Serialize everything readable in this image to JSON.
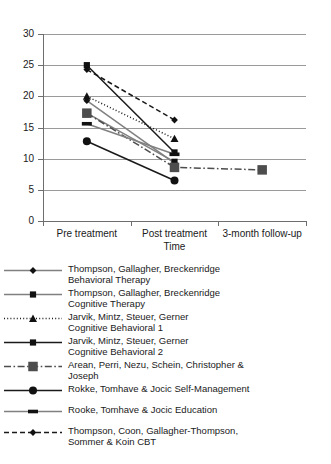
{
  "chart_data": {
    "type": "line",
    "title": "",
    "xlabel": "Time",
    "ylabel": "",
    "categories": [
      "Pre treatment",
      "Post treatment",
      "3-month follow-up"
    ],
    "ylim": [
      0,
      30
    ],
    "yticks": [
      0,
      5,
      10,
      15,
      20,
      25,
      30
    ],
    "grid": true,
    "legend_position": "below",
    "series": [
      {
        "name": "Thompson, Gallagher, Breckenridge Behavioral Therapy",
        "label_line1": "Thompson, Gallagher, Breckenridge",
        "label_line2": "Behavioral Therapy",
        "marker": "diamond",
        "line_style": "solid",
        "color": "#808080",
        "values": [
          19.3,
          9.3,
          null
        ]
      },
      {
        "name": "Thompson, Gallagher, Breckenridge Cognitive Therapy",
        "label_line1": "Thompson, Gallagher, Breckenridge",
        "label_line2": "Cognitive Therapy",
        "marker": "square",
        "line_style": "solid",
        "color": "#808080",
        "values": [
          17.3,
          9.5,
          null
        ]
      },
      {
        "name": "Jarvik, Mintz, Steuer, Gerner Cognitive Behavioral 1",
        "label_line1": "Jarvik, Mintz, Steuer, Gerner",
        "label_line2": "Cognitive Behavioral 1",
        "marker": "triangle",
        "line_style": "dotted",
        "color": "#1a1a1a",
        "values": [
          20.0,
          13.2,
          null
        ]
      },
      {
        "name": "Jarvik, Mintz, Steuer, Gerner Cognitive Behavioral 2",
        "label_line1": "Jarvik, Mintz, Steuer, Gerner",
        "label_line2": "Cognitive Behavioral 2",
        "marker": "square",
        "line_style": "solid",
        "color": "#1a1a1a",
        "values": [
          25.0,
          11.0,
          null
        ]
      },
      {
        "name": "Arean, Perri, Nezu, Schein, Christopher & Joseph",
        "label_line1": "Arean, Perri, Nezu, Schein, Christopher &",
        "label_line2": "Joseph",
        "marker": "square-large-gray",
        "line_style": "dashdot",
        "color": "#4d4d4d",
        "values": [
          17.3,
          8.6,
          8.2
        ]
      },
      {
        "name": "Rokke, Tomhave & Jocic Self-Management",
        "label_line1": "Rokke, Tomhave & Jocic Self-Management",
        "label_line2": "",
        "marker": "circle",
        "line_style": "solid",
        "color": "#1a1a1a",
        "values": [
          12.8,
          6.5,
          null
        ]
      },
      {
        "name": "Rooke, Tomhave & Jocic Education",
        "label_line1": "Rooke, Tomhave & Jocic Education",
        "label_line2": "",
        "marker": "bar",
        "line_style": "solid",
        "color": "#808080",
        "values": [
          15.6,
          10.7,
          null
        ]
      },
      {
        "name": "Thompson, Coon, Gallagher-Thompson, Sommer & Koin CBT",
        "label_line1": "Thompson, Coon, Gallagher-Thompson,",
        "label_line2": "Sommer & Koin CBT",
        "marker": "diamond",
        "line_style": "dashed",
        "color": "#1a1a1a",
        "values": [
          24.3,
          16.2,
          null
        ]
      }
    ]
  }
}
